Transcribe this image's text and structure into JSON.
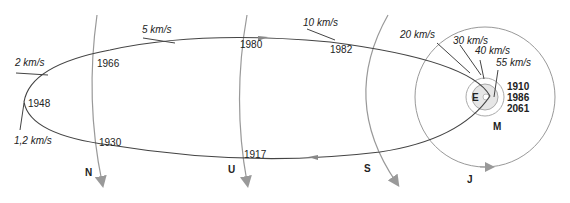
{
  "diagram": {
    "title": "",
    "colors": {
      "orbit": "#444444",
      "planet_orbit": "#999999",
      "text": "#222222"
    },
    "speeds": [
      "2 km/s",
      "5 km/s",
      "10 km/s",
      "20 km/s",
      "30 km/s",
      "40 km/s",
      "55 km/s",
      "1,2 km/s"
    ],
    "years": [
      "1966",
      "1948",
      "1930",
      "1980",
      "1982",
      "1917"
    ],
    "perihelion_years": [
      "1910",
      "1986",
      "2061"
    ],
    "planets": {
      "neptune": "N",
      "uranus": "U",
      "saturn": "S",
      "jupiter": "J",
      "earth": "E",
      "mars": "M"
    }
  }
}
